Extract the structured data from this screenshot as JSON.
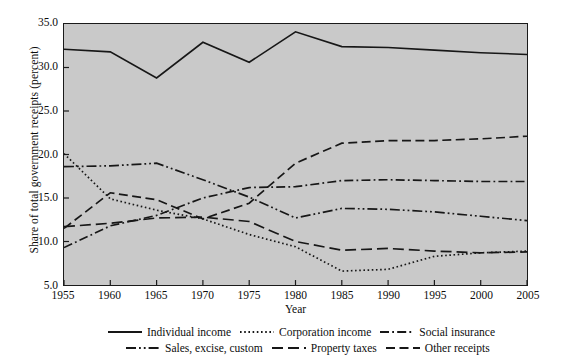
{
  "chart_data": {
    "type": "line",
    "title": "",
    "xlabel": "Year",
    "ylabel": "Share of total government receipts (percent)",
    "xlim": [
      1955,
      2005
    ],
    "ylim": [
      5.0,
      35.0
    ],
    "grid": false,
    "legend_position": "bottom",
    "background": "#c9c9c9",
    "x": [
      1955,
      1960,
      1965,
      1970,
      1975,
      1980,
      1985,
      1990,
      1995,
      2000,
      2005
    ],
    "xticks": [
      "1955",
      "1960",
      "1965",
      "1970",
      "1975",
      "1980",
      "1985",
      "1990",
      "1995",
      "2000",
      "2005"
    ],
    "yticks": [
      "5.0",
      "10.0",
      "15.0",
      "20.0",
      "25.0",
      "30.0",
      "35.0"
    ],
    "ytick_values": [
      5.0,
      10.0,
      15.0,
      20.0,
      25.0,
      30.0,
      35.0
    ],
    "series": [
      {
        "name": "Individual income",
        "style": "solid",
        "values": [
          32.1,
          31.8,
          28.8,
          32.9,
          30.6,
          34.1,
          32.4,
          32.3,
          32.0,
          31.7,
          31.5
        ]
      },
      {
        "name": "Corporation income",
        "style": "dotted",
        "values": [
          20.1,
          14.9,
          13.6,
          12.6,
          10.8,
          9.4,
          6.6,
          6.8,
          8.3,
          8.7,
          8.9
        ]
      },
      {
        "name": "Social insurance",
        "style": "dash-dot",
        "values": [
          9.3,
          11.8,
          13.0,
          15.0,
          16.2,
          16.3,
          17.0,
          17.1,
          17.0,
          16.9,
          16.9
        ]
      },
      {
        "name": "Sales, excise, custom",
        "style": "dash-dot-dot",
        "values": [
          18.6,
          18.7,
          19.0,
          17.1,
          15.1,
          12.7,
          13.8,
          13.7,
          13.4,
          12.9,
          12.4
        ]
      },
      {
        "name": "Property taxes",
        "style": "long-dash",
        "values": [
          11.7,
          12.1,
          12.7,
          12.8,
          12.3,
          10.0,
          9.0,
          9.2,
          8.9,
          8.7,
          8.8
        ]
      },
      {
        "name": "Other receipts",
        "style": "dash",
        "values": [
          11.5,
          15.6,
          14.8,
          12.6,
          14.4,
          19.0,
          21.3,
          21.6,
          21.6,
          21.8,
          22.1
        ]
      }
    ]
  },
  "legend": {
    "rows": [
      [
        {
          "label": "Individual income",
          "style": "solid"
        },
        {
          "label": "Corporation income",
          "style": "dotted"
        },
        {
          "label": "Social insurance",
          "style": "dash-dot"
        }
      ],
      [
        {
          "label": "Sales, excise, custom",
          "style": "dash-dot-dot"
        },
        {
          "label": "Property taxes",
          "style": "long-dash"
        },
        {
          "label": "Other receipts",
          "style": "dash"
        }
      ]
    ]
  }
}
